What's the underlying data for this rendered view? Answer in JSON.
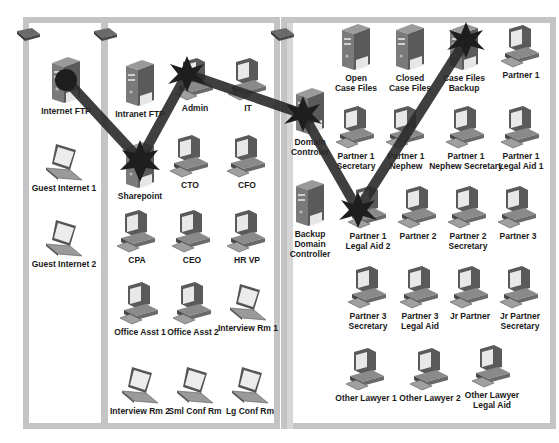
{
  "diagram": {
    "type": "network-attack-path",
    "segments": [
      {
        "id": "left",
        "label": "Internet DMZ"
      },
      {
        "id": "middle",
        "label": "Office LAN"
      },
      {
        "id": "right",
        "label": "Legal LAN"
      }
    ],
    "nodes": {
      "internet_ftp": {
        "label": "Internet FTP",
        "icon": "server"
      },
      "guest_internet_1": {
        "label": "Guest Internet 1",
        "icon": "laptop"
      },
      "guest_internet_2": {
        "label": "Guest Internet 2",
        "icon": "laptop"
      },
      "intranet_ftp": {
        "label": "Intranet FTP",
        "icon": "server"
      },
      "admin": {
        "label": "Admin",
        "icon": "desktop"
      },
      "it": {
        "label": "IT",
        "icon": "desktop"
      },
      "sharepoint": {
        "label": "Sharepoint",
        "icon": "server"
      },
      "cto": {
        "label": "CTO",
        "icon": "desktop"
      },
      "cfo": {
        "label": "CFO",
        "icon": "desktop"
      },
      "cpa": {
        "label": "CPA",
        "icon": "desktop"
      },
      "ceo": {
        "label": "CEO",
        "icon": "desktop"
      },
      "hr_vp": {
        "label": "HR VP",
        "icon": "desktop"
      },
      "office_asst_1": {
        "label": "Office Asst 1",
        "icon": "desktop"
      },
      "office_asst_2": {
        "label": "Office Asst 2",
        "icon": "desktop"
      },
      "interview_rm_1": {
        "label": "Interview Rm 1",
        "icon": "laptop"
      },
      "interview_rm_2": {
        "label": "Interview Rm 2",
        "icon": "laptop"
      },
      "sml_conf_rm": {
        "label": "Sml Conf Rm",
        "icon": "laptop"
      },
      "lg_conf_rm": {
        "label": "Lg Conf Rm",
        "icon": "laptop"
      },
      "domain_controler": {
        "label": "Domain\nControler",
        "icon": "server"
      },
      "backup_domain_controller": {
        "label": "Backup\nDomain\nController",
        "icon": "server"
      },
      "open_case_files": {
        "label": "Open\nCase Files",
        "icon": "server"
      },
      "closed_case_files": {
        "label": "Closed\nCase Files",
        "icon": "server"
      },
      "case_files_backup": {
        "label": "Case Files\nBackup",
        "icon": "server"
      },
      "partner_1": {
        "label": "Partner 1",
        "icon": "desktop"
      },
      "partner_1_secretary": {
        "label": "Partner 1\nSecretary",
        "icon": "desktop"
      },
      "partner_1_nephew": {
        "label": "Partner 1\nNephew",
        "icon": "desktop"
      },
      "partner_1_nephew_secretary": {
        "label": "Partner 1\nNephew Secretary",
        "icon": "desktop"
      },
      "partner_1_legal_aid_1": {
        "label": "Partner 1\nLegal Aid 1",
        "icon": "desktop"
      },
      "partner_1_legal_aid_2": {
        "label": "Partner 1\nLegal Aid 2",
        "icon": "desktop"
      },
      "partner_2": {
        "label": "Partner 2",
        "icon": "desktop"
      },
      "partner_2_secretary": {
        "label": "Partner 2\nSecretary",
        "icon": "desktop"
      },
      "partner_3": {
        "label": "Partner 3",
        "icon": "desktop"
      },
      "partner_3_secretary": {
        "label": "Partner 3\nSecretary",
        "icon": "desktop"
      },
      "partner_3_legal_aid": {
        "label": "Partner 3\nLegal Aid",
        "icon": "desktop"
      },
      "jr_partner": {
        "label": "Jr Partner",
        "icon": "desktop"
      },
      "jr_partner_secretary": {
        "label": "Jr Partner\nSecretary",
        "icon": "desktop"
      },
      "other_lawyer_1": {
        "label": "Other Lawyer 1",
        "icon": "desktop"
      },
      "other_lawyer_2": {
        "label": "Other Lawyer 2",
        "icon": "desktop"
      },
      "other_lawyer_legal_aid": {
        "label": "Other Lawyer\nLegal Aid",
        "icon": "desktop"
      }
    },
    "attack_path": [
      "internet_ftp",
      "sharepoint",
      "admin",
      "domain_controler",
      "partner_1_legal_aid_2",
      "case_files_backup"
    ],
    "colors": {
      "panel_border": "#c4c4c4",
      "attack_path": "#2a2a2a",
      "label": "#1a1a1a"
    }
  }
}
